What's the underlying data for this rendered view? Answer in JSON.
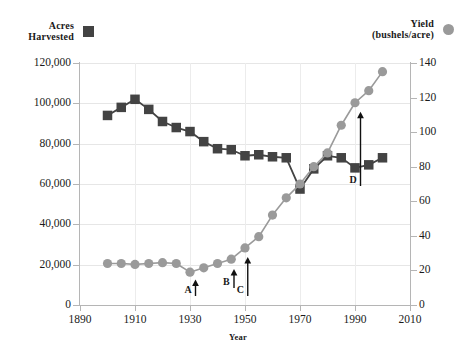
{
  "legend": {
    "acres": {
      "label": "Acres\nHarvested",
      "marker": "filled-square",
      "color": "#434343"
    },
    "yield": {
      "label": "Yield\n(bushels/acre)",
      "marker": "filled-circle",
      "color": "#9a9a9a"
    }
  },
  "axes": {
    "x": {
      "title": "Year",
      "ticks": [
        "1890",
        "1910",
        "1930",
        "1950",
        "1970",
        "1990",
        "2010"
      ],
      "min": 1890,
      "max": 2010
    },
    "y_left": {
      "ticks": [
        "0",
        "20,000",
        "40,000",
        "60,000",
        "80,000",
        "100,000",
        "120,000"
      ],
      "min": 0,
      "max": 120000
    },
    "y_right": {
      "ticks": [
        "0",
        "20",
        "40",
        "60",
        "80",
        "100",
        "120",
        "140"
      ],
      "min": 0,
      "max": 140
    }
  },
  "annotations": [
    {
      "label": "A",
      "x_year": 1932,
      "tip_value": 20
    },
    {
      "label": "B",
      "x_year": 1946,
      "tip_value": 26
    },
    {
      "label": "C",
      "x_year": 1951,
      "tip_value": 33
    },
    {
      "label": "D",
      "x_year": 1992,
      "tip_value": 117
    }
  ],
  "chart_data": {
    "type": "line",
    "title": "",
    "xlabel": "Year",
    "ylabel": "Acres Harvested",
    "ylabel_secondary": "Yield (bushels/acre)",
    "xlim": [
      1890,
      2010
    ],
    "ylim": [
      0,
      120000
    ],
    "ylim_secondary": [
      0,
      140
    ],
    "grid": true,
    "legend_position": "top",
    "x": [
      1900,
      1905,
      1910,
      1915,
      1920,
      1925,
      1930,
      1935,
      1940,
      1945,
      1950,
      1955,
      1960,
      1965,
      1970,
      1975,
      1980,
      1985,
      1990,
      1995,
      2000
    ],
    "series": [
      {
        "name": "Acres Harvested",
        "axis": "left",
        "marker": "square",
        "color": "#434343",
        "units": "acres",
        "values": [
          94000,
          98000,
          102000,
          97000,
          91000,
          88000,
          86000,
          81000,
          77500,
          77000,
          74000,
          74500,
          73500,
          73000,
          57500,
          67500,
          74000,
          73000,
          68000,
          69500,
          73000
        ]
      },
      {
        "name": "Yield",
        "axis": "right",
        "marker": "circle",
        "color": "#9a9a9a",
        "units": "bushels/acre",
        "values": [
          24,
          24,
          23.5,
          24,
          24.5,
          24,
          19,
          21.5,
          24,
          26.5,
          33,
          39.5,
          52,
          62,
          70,
          80,
          88,
          104,
          117,
          124,
          135
        ]
      }
    ]
  }
}
